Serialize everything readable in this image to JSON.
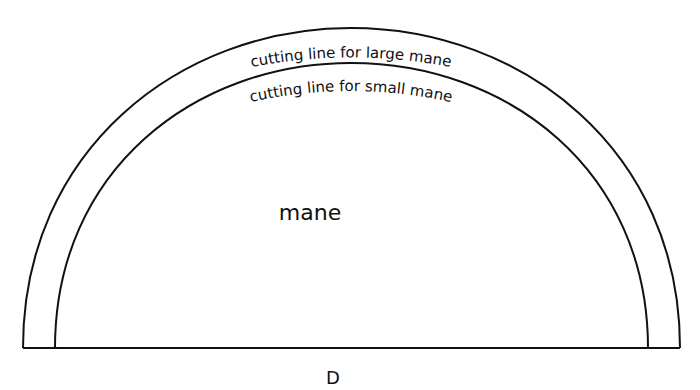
{
  "pattern": {
    "outer_label": "cutting line for large mane",
    "inner_label": "cutting line for small mane",
    "center_label": "mane",
    "piece_letter": "D"
  },
  "colors": {
    "line": "#111111",
    "background": "#ffffff"
  }
}
